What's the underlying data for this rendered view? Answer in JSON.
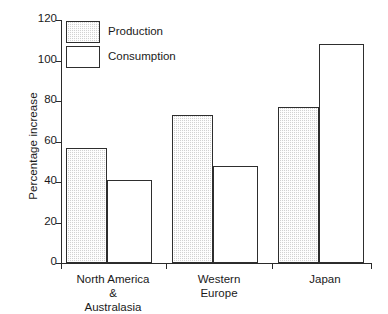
{
  "chart_data": {
    "type": "bar",
    "title": "",
    "xlabel": "",
    "ylabel": "Percentage increase",
    "ylim": [
      0,
      120
    ],
    "yticks": [
      0,
      20,
      40,
      60,
      80,
      100,
      120
    ],
    "ytick_labels": [
      "0",
      "20",
      "40",
      "60",
      "80",
      "100",
      "120"
    ],
    "grid": false,
    "legend_position": "upper left",
    "categories": [
      "North America\n&\nAustralasia",
      "Western\nEurope",
      "Japan"
    ],
    "category_labels_flat": [
      "North America & Australasia",
      "Western Europe",
      "Japan"
    ],
    "series": [
      {
        "name": "Production",
        "values": [
          57,
          73,
          77
        ]
      },
      {
        "name": "Consumption",
        "values": [
          41,
          48,
          108
        ]
      }
    ]
  },
  "legend": {
    "items": [
      {
        "label": "Production",
        "swatch": "hatched-grey"
      },
      {
        "label": "Consumption",
        "swatch": "white"
      }
    ]
  },
  "axis": {
    "y_title": "Percentage increase",
    "y_ticks": [
      "120",
      "100",
      "80",
      "60",
      "40",
      "20",
      "0"
    ]
  },
  "categories": [
    {
      "label": "North America\n&\nAustralasia"
    },
    {
      "label": "Western\nEurope"
    },
    {
      "label": "Japan"
    }
  ]
}
